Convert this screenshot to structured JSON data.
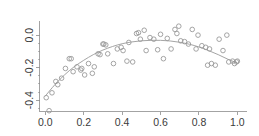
{
  "chart_data": {
    "type": "scatter",
    "title": "",
    "subtitle": "",
    "xlabel": "",
    "ylabel": "",
    "xlim": [
      -0.03,
      1.05
    ],
    "ylim": [
      -0.47,
      0.09
    ],
    "grid": false,
    "legend": null,
    "xticks": [
      0.0,
      0.2,
      0.4,
      0.6,
      0.8,
      1.0
    ],
    "xticklabels": [
      "0.0",
      "0.2",
      "0.4",
      "0.6",
      "0.8",
      "1.0"
    ],
    "yticks": [
      0.0,
      -0.2,
      -0.4
    ],
    "yticklabels": [
      "0.0",
      "-0.2",
      "-0.4"
    ],
    "yticklabel_rotation": 90,
    "minor_yticks": [
      -0.05,
      -0.1,
      -0.15,
      -0.25,
      -0.3,
      -0.35,
      -0.45
    ],
    "marker": "open-circle",
    "marker_color": "#9a9a9a",
    "series": [
      {
        "name": "observations",
        "x": [
          0.005,
          0.02,
          0.035,
          0.055,
          0.065,
          0.085,
          0.105,
          0.125,
          0.135,
          0.145,
          0.165,
          0.185,
          0.19,
          0.205,
          0.225,
          0.245,
          0.255,
          0.275,
          0.285,
          0.3,
          0.305,
          0.315,
          0.325,
          0.355,
          0.375,
          0.395,
          0.405,
          0.425,
          0.435,
          0.455,
          0.475,
          0.485,
          0.495,
          0.515,
          0.525,
          0.545,
          0.565,
          0.585,
          0.6,
          0.615,
          0.635,
          0.655,
          0.675,
          0.685,
          0.695,
          0.705,
          0.725,
          0.745,
          0.765,
          0.785,
          0.795,
          0.815,
          0.835,
          0.845,
          0.855,
          0.865,
          0.885,
          0.905,
          0.925,
          0.945,
          0.955,
          0.975,
          0.985,
          0.995,
          1.0
        ],
        "y": [
          -0.385,
          -0.465,
          -0.355,
          -0.285,
          -0.305,
          -0.265,
          -0.205,
          -0.145,
          -0.145,
          -0.225,
          -0.195,
          -0.215,
          -0.205,
          -0.245,
          -0.175,
          -0.235,
          -0.195,
          -0.115,
          -0.12,
          -0.055,
          -0.055,
          -0.06,
          -0.115,
          -0.175,
          -0.085,
          -0.075,
          -0.095,
          -0.16,
          -0.045,
          -0.165,
          0.01,
          0.015,
          -0.025,
          0.03,
          -0.095,
          -0.015,
          -0.025,
          -0.09,
          0.005,
          -0.145,
          -0.02,
          -0.085,
          0.035,
          0.01,
          0.055,
          -0.035,
          -0.04,
          -0.055,
          0.035,
          -0.085,
          0.0,
          -0.065,
          -0.075,
          -0.185,
          -0.085,
          -0.175,
          -0.185,
          -0.025,
          -0.095,
          0.0,
          -0.165,
          -0.16,
          -0.175,
          -0.165,
          -0.16
        ]
      }
    ],
    "fit": {
      "name": "smoothed-fit-curve",
      "type": "loess-quadratic",
      "color": "#9a9a9a",
      "x": [
        0.0,
        0.05,
        0.1,
        0.15,
        0.2,
        0.25,
        0.3,
        0.35,
        0.4,
        0.45,
        0.5,
        0.55,
        0.6,
        0.65,
        0.7,
        0.75,
        0.8,
        0.85,
        0.9,
        0.95,
        1.0
      ],
      "y": [
        -0.375,
        -0.305,
        -0.245,
        -0.195,
        -0.155,
        -0.12,
        -0.092,
        -0.07,
        -0.053,
        -0.042,
        -0.035,
        -0.032,
        -0.032,
        -0.036,
        -0.044,
        -0.056,
        -0.073,
        -0.095,
        -0.12,
        -0.148,
        -0.172
      ]
    }
  }
}
